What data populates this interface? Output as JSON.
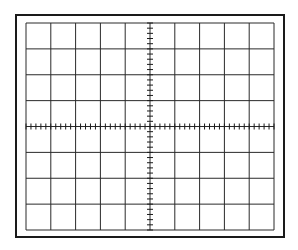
{
  "diagram": {
    "type": "oscilloscope-graticule",
    "frame": {
      "x": 16,
      "y": 15,
      "width": 268,
      "height": 222,
      "stroke": "#1a1a1a",
      "stroke_width": 2
    },
    "grid": {
      "x": 26,
      "y": 23,
      "width": 248,
      "height": 207,
      "columns": 10,
      "rows": 8,
      "stroke": "#2a2a2a",
      "stroke_width": 1
    },
    "axes": {
      "center_vertical_ticks_per_division": 5,
      "center_horizontal_ticks_per_division": 5,
      "tick_length": 6,
      "stroke": "#1a1a1a"
    },
    "background": "#ffffff"
  }
}
